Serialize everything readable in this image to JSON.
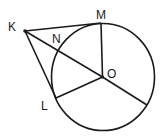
{
  "diagram": {
    "type": "geometry-circle-tangents",
    "colors": {
      "stroke": "#1a1a1a",
      "background": "#ffffff"
    },
    "circle": {
      "center_label": "O",
      "cx": 103,
      "cy": 77,
      "rx": 51.5,
      "ry": 53.5
    },
    "points": {
      "K": {
        "label": "K",
        "x": 25,
        "y": 31,
        "lx": 8,
        "ly": 31
      },
      "M": {
        "label": "M",
        "x": 101,
        "y": 23,
        "lx": 96,
        "ly": 19
      },
      "N": {
        "label": "N",
        "x": 58,
        "y": 51,
        "lx": 52,
        "ly": 43
      },
      "O": {
        "label": "O",
        "x": 102.5,
        "y": 77,
        "lx": 107,
        "ly": 78
      },
      "L": {
        "label": "L",
        "x": 56,
        "y": 98,
        "lx": 41,
        "ly": 110
      },
      "P": {
        "x": 147,
        "y": 105
      }
    },
    "segments": [
      [
        "K",
        "M"
      ],
      [
        "K",
        "L"
      ],
      [
        "K",
        "O"
      ],
      [
        "M",
        "O"
      ],
      [
        "L",
        "O"
      ],
      [
        "O",
        "P"
      ]
    ]
  }
}
